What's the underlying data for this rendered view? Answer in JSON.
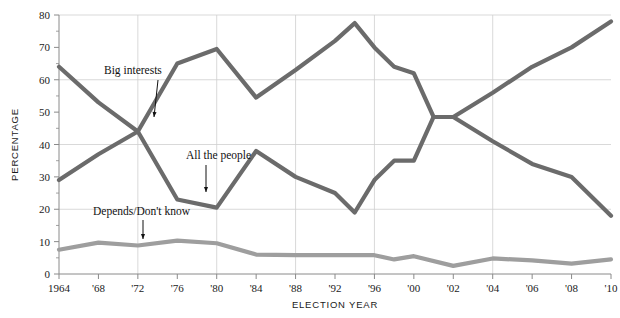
{
  "chart_data": {
    "type": "line",
    "title": "",
    "xlabel": "ELECTION YEAR",
    "ylabel": "PERCENTAGE",
    "ylim": [
      0,
      80
    ],
    "ytick_step": 10,
    "yminor_step": 5,
    "grid": "y-gridlines at 20,40,60,80; x-gridlines at 1972,1980,1988,1996,2004",
    "legend_position": "inline annotations with arrows",
    "x": [
      1964,
      1966,
      1968,
      1970,
      1972,
      1974,
      1976,
      1978,
      1980,
      1982,
      1984,
      1986,
      1988,
      1990,
      1992,
      1994,
      1996,
      1998,
      2000,
      2002,
      2004,
      2006,
      2008,
      2010
    ],
    "xtick_labels": [
      "1964",
      "'68",
      "'72",
      "'76",
      "'80",
      "'84",
      "'88",
      "'92",
      "'96",
      "'00",
      "'02",
      "'04",
      "'06",
      "'08",
      "'10"
    ],
    "xtick_values": [
      1964,
      1968,
      1972,
      1976,
      1980,
      1984,
      1988,
      1992,
      1996,
      2000,
      2002,
      2004,
      2006,
      2008,
      2010
    ],
    "gridline_years": [
      1972,
      1980,
      1988,
      1996,
      2004
    ],
    "ytick_labels": [
      "0",
      "10",
      "20",
      "30",
      "40",
      "50",
      "60",
      "70",
      "80"
    ],
    "ytick_values": [
      0,
      10,
      20,
      30,
      40,
      50,
      60,
      70,
      80
    ],
    "ygrid_values": [
      20,
      40,
      60,
      80
    ],
    "series": [
      {
        "name": "All the people",
        "color": "#6b6b6b",
        "points": [
          [
            1964,
            64
          ],
          [
            1968,
            53
          ],
          [
            1972,
            44
          ],
          [
            1976,
            23
          ],
          [
            1980,
            20.5
          ],
          [
            1984,
            38
          ],
          [
            1988,
            30
          ],
          [
            1992,
            25
          ],
          [
            1994,
            19
          ],
          [
            1996,
            29
          ],
          [
            1998,
            35
          ],
          [
            2000,
            35
          ],
          [
            2001,
            48.5
          ],
          [
            2002,
            48.5
          ],
          [
            2004,
            41
          ],
          [
            2006,
            34
          ],
          [
            2008,
            30
          ],
          [
            2010,
            18
          ]
        ]
      },
      {
        "name": "Big interests",
        "color": "#6b6b6b",
        "points": [
          [
            1964,
            29
          ],
          [
            1968,
            37
          ],
          [
            1972,
            44
          ],
          [
            1976,
            65
          ],
          [
            1980,
            69.5
          ],
          [
            1984,
            54.5
          ],
          [
            1988,
            63
          ],
          [
            1992,
            72
          ],
          [
            1994,
            77.5
          ],
          [
            1996,
            70
          ],
          [
            1998,
            64
          ],
          [
            2000,
            62
          ],
          [
            2001,
            48.5
          ],
          [
            2002,
            48.5
          ],
          [
            2004,
            56
          ],
          [
            2006,
            64
          ],
          [
            2008,
            70
          ],
          [
            2010,
            78
          ]
        ]
      },
      {
        "name": "Depends/Don't know",
        "color": "#9e9e9e",
        "points": [
          [
            1964,
            7.5
          ],
          [
            1968,
            9.7
          ],
          [
            1972,
            8.8
          ],
          [
            1976,
            10.3
          ],
          [
            1980,
            9.5
          ],
          [
            1984,
            6
          ],
          [
            1988,
            5.8
          ],
          [
            1992,
            5.8
          ],
          [
            1996,
            5.8
          ],
          [
            1998,
            4.5
          ],
          [
            2000,
            5.5
          ],
          [
            2002,
            2.5
          ],
          [
            2004,
            4.8
          ],
          [
            2006,
            4.2
          ],
          [
            2008,
            3.2
          ],
          [
            2010,
            4.5
          ]
        ]
      }
    ],
    "annotations": [
      {
        "label": "Big interests",
        "text_x": 104,
        "text_y": 74,
        "arrow_from_x": 158,
        "arrow_from_y": 80,
        "arrow_to_x": 154,
        "arrow_to_y": 117
      },
      {
        "label": "All the people",
        "text_x": 186,
        "text_y": 159,
        "arrow_from_x": 206,
        "arrow_from_y": 165,
        "arrow_to_x": 206,
        "arrow_to_y": 192
      },
      {
        "label": "Depends/Don't know",
        "text_x": 93,
        "text_y": 215,
        "arrow_from_x": 143,
        "arrow_from_y": 220,
        "arrow_to_x": 143,
        "arrow_to_y": 239
      }
    ]
  },
  "plot_geometry": {
    "left": 59,
    "right": 611,
    "top": 15,
    "bottom": 274,
    "x_min": 1964,
    "x_max": 2010,
    "year_positions_note": "4-year steps to 1996 then 2-year steps, uniform tick spacing"
  }
}
